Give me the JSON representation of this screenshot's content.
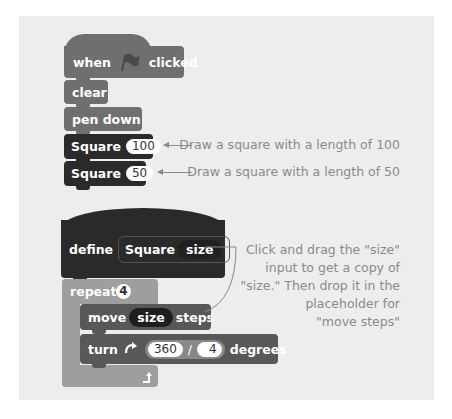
{
  "script1": {
    "hat": {
      "when": "when",
      "flag_icon": "green-flag",
      "clicked": "clicked"
    },
    "blocks": [
      {
        "label": "clear"
      },
      {
        "label": "pen down"
      },
      {
        "label": "Square",
        "arg": "100"
      },
      {
        "label": "Square",
        "arg": "50"
      }
    ]
  },
  "annotations": {
    "square100": "Draw a square with a length of 100",
    "square50": "Draw a square with a length of 50",
    "drag_note": [
      "Click and drag the \"size\"",
      "input to get a copy of",
      "\"size.\" Then drop it in the",
      "placeholder for",
      "\"move steps\""
    ]
  },
  "script2": {
    "define": {
      "keyword": "define",
      "name": "Square",
      "param": "size"
    },
    "repeat": {
      "label": "repeat",
      "count": "4",
      "loop_icon": "loop-arrow"
    },
    "move": {
      "label": "move",
      "arg": "size",
      "suffix": "steps"
    },
    "turn": {
      "label": "turn",
      "icon": "turn-clockwise",
      "numerator": "360",
      "op": "/",
      "denominator": "4",
      "suffix": "degrees"
    }
  }
}
